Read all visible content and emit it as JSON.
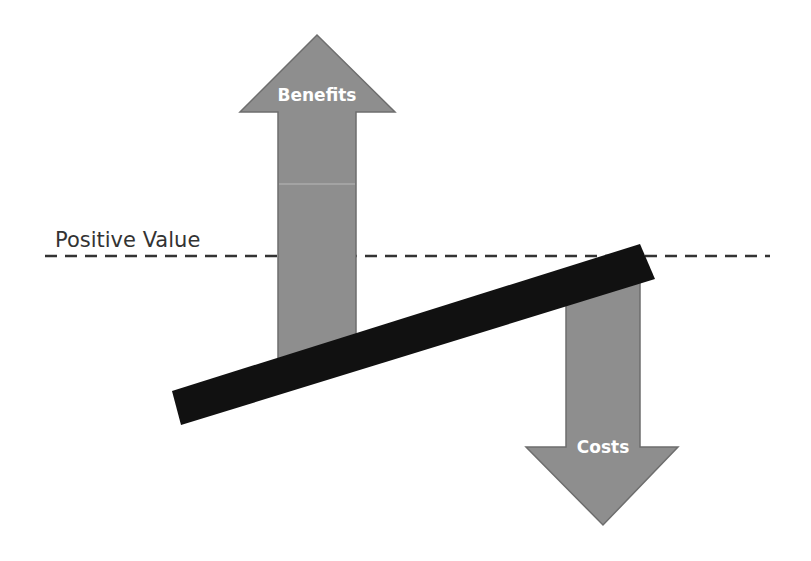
{
  "diagram": {
    "threshold_label": "Positive Value",
    "benefits_label": "Benefits",
    "costs_label": "Costs",
    "colors": {
      "arrow_fill": "#8e8e8e",
      "arrow_stroke": "#6e6e6e",
      "beam": "#111111",
      "dashed_line": "#333333",
      "label_text": "#ffffff",
      "threshold_text": "#333333"
    }
  }
}
